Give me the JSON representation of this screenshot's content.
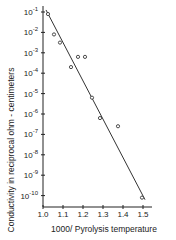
{
  "chart_data": {
    "type": "scatter",
    "title": "",
    "xlabel": "1000/ Pyrolysis temperature",
    "ylabel": "Conductivity  in reciprocal ohm - centimeters",
    "xlim": [
      1.0,
      1.55
    ],
    "ylim_log10": [
      -10.5,
      -1
    ],
    "yscale": "log",
    "grid": false,
    "legend": null,
    "x_ticks": [
      "1.0",
      "1.1",
      "1.2",
      "1.3",
      "1.4",
      "1.5"
    ],
    "y_ticks": [
      "10^-1",
      "10^-2",
      "10^-3",
      "10^-4",
      "10^-5",
      "10^-6",
      "10^-7",
      "10^-8",
      "10^-9",
      "10^-10"
    ],
    "series": [
      {
        "name": "measured",
        "marker": "open-circle",
        "points": [
          {
            "x": 1.025,
            "log10_y": -1.1
          },
          {
            "x": 1.055,
            "log10_y": -2.1
          },
          {
            "x": 1.085,
            "log10_y": -2.5
          },
          {
            "x": 1.14,
            "log10_y": -3.7
          },
          {
            "x": 1.175,
            "log10_y": -3.2
          },
          {
            "x": 1.21,
            "log10_y": -3.2
          },
          {
            "x": 1.245,
            "log10_y": -5.2
          },
          {
            "x": 1.285,
            "log10_y": -6.2
          },
          {
            "x": 1.375,
            "log10_y": -6.6
          },
          {
            "x": 1.495,
            "log10_y": -10.1
          }
        ]
      },
      {
        "name": "fit",
        "type": "line",
        "points": [
          {
            "x": 1.015,
            "log10_y": -0.9
          },
          {
            "x": 1.51,
            "log10_y": -10.2
          }
        ]
      }
    ]
  }
}
